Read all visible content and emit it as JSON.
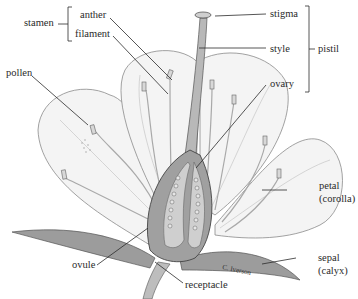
{
  "diagram": {
    "type": "labeled anatomical illustration",
    "labels": {
      "stamen": "stamen",
      "anther": "anther",
      "filament": "filament",
      "pollen": "pollen",
      "stigma": "stigma",
      "style": "style",
      "pistil": "pistil",
      "ovary": "ovary",
      "petal": "petal",
      "corolla": "(corolla)",
      "sepal": "sepal",
      "calyx": "(calyx)",
      "ovule": "ovule",
      "receptacle": "receptacle"
    },
    "groups": [
      {
        "name": "stamen",
        "members": [
          "anther",
          "filament"
        ]
      },
      {
        "name": "pistil",
        "members": [
          "stigma",
          "style",
          "ovary"
        ]
      }
    ],
    "signature": "C. Iverson"
  }
}
